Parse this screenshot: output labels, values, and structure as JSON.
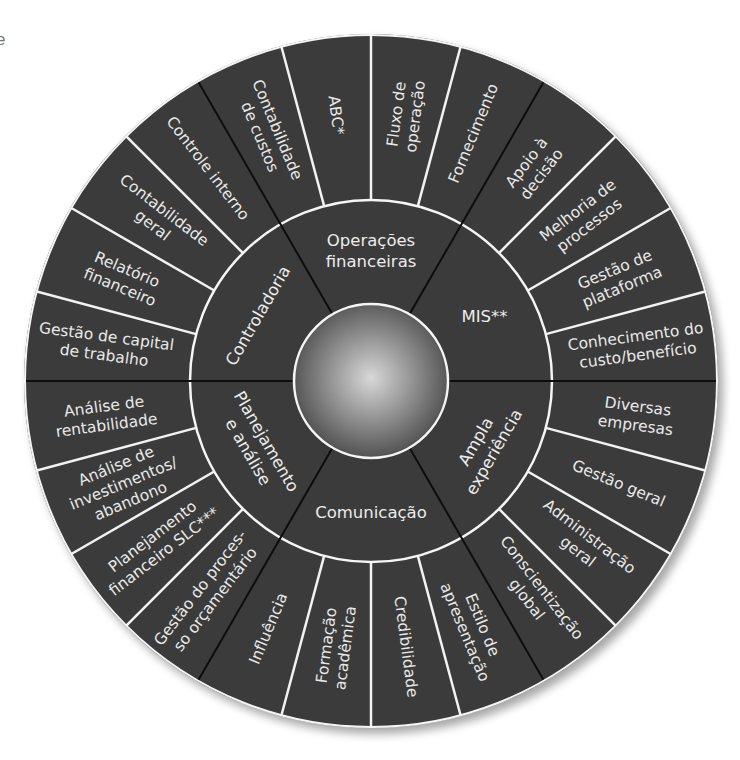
{
  "stray_text": "e",
  "colors": {
    "wheel_fill": "#3b3b3b",
    "item_divider": "#f2f2f2",
    "sector_divider": "#0d0d0d",
    "ring_outline": "#f5f5f5",
    "sphere_light": "#d8d8d8",
    "sphere_dark": "#4a4a4a"
  },
  "center": {
    "label": ""
  },
  "sectors": [
    {
      "name": "MIS",
      "label_lines": [
        "MIS**"
      ],
      "items": [
        {
          "lines": [
            "Conhecimento do",
            "custo/benefício"
          ]
        },
        {
          "lines": [
            "Gestão de",
            "plataforma"
          ]
        },
        {
          "lines": [
            "Melhoria de",
            "processos"
          ]
        },
        {
          "lines": [
            "Apoio à",
            "decisão"
          ]
        }
      ]
    },
    {
      "name": "Operações financeiras",
      "label_lines": [
        "Operações",
        "financeiras"
      ],
      "items": [
        {
          "lines": [
            "Fornecimento"
          ]
        },
        {
          "lines": [
            "Fluxo de",
            "operação"
          ]
        },
        {
          "lines": [
            "ABC*"
          ]
        },
        {
          "lines": [
            "Contabilidade",
            "de custos"
          ]
        }
      ]
    },
    {
      "name": "Controladoria",
      "label_lines": [
        "Controladoria"
      ],
      "items": [
        {
          "lines": [
            "Controle interno"
          ]
        },
        {
          "lines": [
            "Contabilidade",
            "geral"
          ]
        },
        {
          "lines": [
            "Relatório",
            "financeiro"
          ]
        },
        {
          "lines": [
            "Gestão de capital",
            "de trabalho"
          ]
        }
      ]
    },
    {
      "name": "Planejamento e análise",
      "label_lines": [
        "Planejamento",
        "e análise"
      ],
      "items": [
        {
          "lines": [
            "Análise de",
            "rentabilidade"
          ]
        },
        {
          "lines": [
            "Análise de",
            "investimentos/",
            "abandono"
          ]
        },
        {
          "lines": [
            "Planejamento",
            "financeiro SLC***"
          ]
        },
        {
          "lines": [
            "Gestão do proces-",
            "so orçamentário"
          ]
        }
      ]
    },
    {
      "name": "Comunicação",
      "label_lines": [
        "Comunicação"
      ],
      "items": [
        {
          "lines": [
            "Influência"
          ]
        },
        {
          "lines": [
            "Formação",
            "acadêmica"
          ]
        },
        {
          "lines": [
            "Credibilidade"
          ]
        },
        {
          "lines": [
            "Estilo de",
            "apresentação"
          ]
        }
      ]
    },
    {
      "name": "Ampla experiência",
      "label_lines": [
        "Ampla",
        "experiência"
      ],
      "items": [
        {
          "lines": [
            "Conscientização",
            "global"
          ]
        },
        {
          "lines": [
            "Administração",
            "geral"
          ]
        },
        {
          "lines": [
            "Gestão geral"
          ]
        },
        {
          "lines": [
            "Diversas",
            "empresas"
          ]
        }
      ]
    }
  ]
}
